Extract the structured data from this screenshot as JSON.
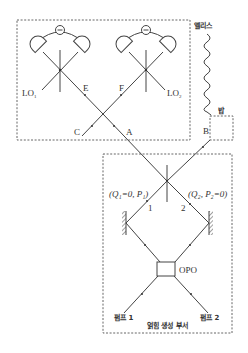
{
  "diagram": {
    "type": "quantum-optics-setup",
    "regions": {
      "measurement": {
        "name": "homodyne-detection-region"
      },
      "entanglement_source": {
        "label": "얽힘 생성 부서"
      },
      "bob_box": {
        "name": "bob-station"
      }
    },
    "parties": {
      "alice": "앨리스",
      "bob": "밥"
    },
    "beam_labels": {
      "A": "A",
      "B": "B",
      "C": "C",
      "E": "E",
      "F": "F",
      "one": "1",
      "two": "2"
    },
    "local_oscillators": {
      "lo1": "LO",
      "lo1_sub": "1",
      "lo2": "LO",
      "lo2_sub": "2"
    },
    "states": {
      "mode1": "(Q₁=0, P₁)",
      "mode2": "(Q₂, P₂=0)"
    },
    "components": {
      "opo": "OPO",
      "pump1": "펌프 1",
      "pump2": "펌프 2",
      "detector_minus": "−"
    },
    "colors": {
      "line": "#444444",
      "dash": "#555555",
      "text": "#333333",
      "background": "#ffffff"
    }
  }
}
